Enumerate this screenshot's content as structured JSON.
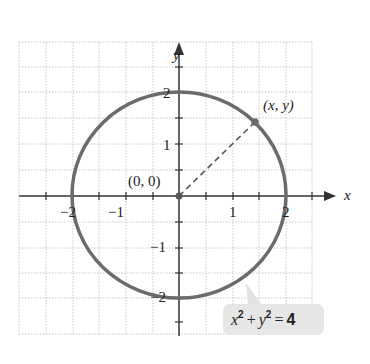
{
  "diagram": {
    "axes": {
      "x_label": "x",
      "y_label": "y"
    },
    "x_ticks": [
      {
        "value": -2,
        "label": "−2"
      },
      {
        "value": -1,
        "label": "−1"
      },
      {
        "value": 1,
        "label": "1"
      },
      {
        "value": 2,
        "label": "2"
      }
    ],
    "y_ticks": [
      {
        "value": 2,
        "label": "2"
      },
      {
        "value": 1,
        "label": "1"
      },
      {
        "value": -1,
        "label": "−1"
      },
      {
        "value": -2,
        "label": "−2"
      }
    ],
    "origin_label": "(0, 0)",
    "point_label": "(x, y)",
    "equation": {
      "left": "x",
      "sq1": "2",
      "plus": "+",
      "mid": "y",
      "sq2": "2",
      "equals": "=",
      "right": "4"
    },
    "circle": {
      "center": [
        0,
        0
      ],
      "radius": 2,
      "color": "#6b6b6b"
    },
    "callout_color": "#e6e6e6"
  }
}
